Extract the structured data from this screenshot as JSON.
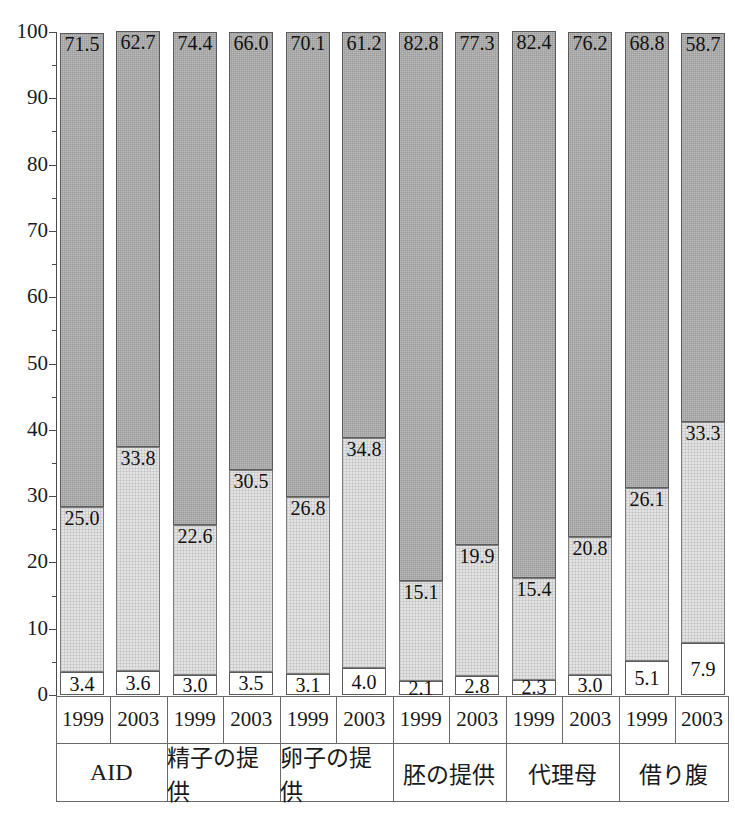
{
  "chart_data": {
    "type": "bar",
    "subtype": "stacked-100-percent",
    "title": "",
    "xlabel": "",
    "ylabel": "",
    "ylim": [
      0,
      100
    ],
    "ytick_step": 10,
    "yminor_step": 5,
    "grid": false,
    "legend": null,
    "ytick_labels": [
      "100",
      "90",
      "80",
      "70",
      "60",
      "50",
      "40",
      "30",
      "20",
      "10",
      "0"
    ],
    "groups": [
      "AID",
      "精子の提供",
      "卵子の提供",
      "胚の提供",
      "代理母",
      "借り腹"
    ],
    "subcategories": [
      "1999",
      "2003"
    ],
    "categories": [
      "AID 1999",
      "AID 2003",
      "精子の提供 1999",
      "精子の提供 2003",
      "卵子の提供 1999",
      "卵子の提供 2003",
      "胚の提供 1999",
      "胚の提供 2003",
      "代理母 1999",
      "代理母 2003",
      "借り腹 1999",
      "借り腹 2003"
    ],
    "series": [
      {
        "name": "bottom",
        "fill": "#ffffff",
        "values": [
          3.4,
          3.6,
          3.0,
          3.5,
          3.1,
          4.0,
          2.1,
          2.8,
          2.3,
          3.0,
          5.1,
          7.9
        ]
      },
      {
        "name": "middle",
        "fill": "#e3e3e3",
        "values": [
          25.0,
          33.8,
          22.6,
          30.5,
          26.8,
          34.8,
          15.1,
          19.9,
          15.4,
          20.8,
          26.1,
          33.3
        ]
      },
      {
        "name": "top",
        "fill": "#9b9b9b",
        "values": [
          71.5,
          62.7,
          74.4,
          66.0,
          70.1,
          61.2,
          82.8,
          77.3,
          82.4,
          76.2,
          68.8,
          58.7
        ]
      }
    ]
  },
  "colors": {
    "segment_top": "#9b9b9b",
    "segment_middle": "#e3e3e3",
    "segment_bottom": "#ffffff",
    "axis": "#4a4a4a",
    "text": "#1a1a1a",
    "table_line": "#6a6a6a"
  }
}
